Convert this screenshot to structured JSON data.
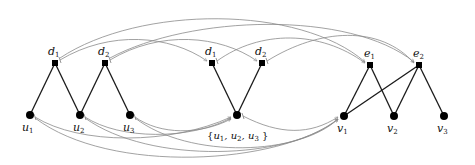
{
  "diagram": {
    "title": "",
    "colors": {
      "edge": "#1a1a1a",
      "arc": "#8a8a8a",
      "node": "#000000",
      "background": "#ffffff"
    },
    "groups": [
      {
        "name": "left-graph",
        "nodes": [
          {
            "id": "L_d1",
            "label": "d",
            "sub": "1",
            "shape": "square",
            "x": 55,
            "y": 63
          },
          {
            "id": "L_d2",
            "label": "d",
            "sub": "2",
            "shape": "square",
            "x": 105,
            "y": 63
          },
          {
            "id": "L_u1",
            "label": "u",
            "sub": "1",
            "shape": "circle",
            "x": 30,
            "y": 115
          },
          {
            "id": "L_u2",
            "label": "u",
            "sub": "2",
            "shape": "circle",
            "x": 80,
            "y": 115
          },
          {
            "id": "L_u3",
            "label": "u",
            "sub": "3",
            "shape": "circle",
            "x": 130,
            "y": 115
          }
        ],
        "edges": [
          [
            "L_d1",
            "L_u1"
          ],
          [
            "L_d1",
            "L_u2"
          ],
          [
            "L_d2",
            "L_u2"
          ],
          [
            "L_d2",
            "L_u3"
          ]
        ]
      },
      {
        "name": "middle-graph",
        "nodes": [
          {
            "id": "M_d1",
            "label": "d",
            "sub": "1",
            "shape": "square",
            "x": 212,
            "y": 63
          },
          {
            "id": "M_d2",
            "label": "d",
            "sub": "2",
            "shape": "square",
            "x": 262,
            "y": 63
          },
          {
            "id": "M_u",
            "label": "{u1, u2, u3}",
            "shape": "circle",
            "x": 237,
            "y": 115
          }
        ],
        "edges": [
          [
            "M_d1",
            "M_u"
          ],
          [
            "M_d2",
            "M_u"
          ]
        ]
      },
      {
        "name": "right-graph",
        "nodes": [
          {
            "id": "R_e1",
            "label": "e",
            "sub": "1",
            "shape": "square",
            "x": 370,
            "y": 65
          },
          {
            "id": "R_e2",
            "label": "e",
            "sub": "2",
            "shape": "square",
            "x": 419,
            "y": 65
          },
          {
            "id": "R_v1",
            "label": "v",
            "sub": "1",
            "shape": "circle",
            "x": 344,
            "y": 116
          },
          {
            "id": "R_v2",
            "label": "v",
            "sub": "2",
            "shape": "circle",
            "x": 394,
            "y": 116
          },
          {
            "id": "R_v3",
            "label": "v",
            "sub": "3",
            "shape": "circle",
            "x": 444,
            "y": 116
          }
        ],
        "edges": [
          [
            "R_e1",
            "R_v1"
          ],
          [
            "R_e1",
            "R_v2"
          ],
          [
            "R_e2",
            "R_v1"
          ],
          [
            "R_e2",
            "R_v2"
          ],
          [
            "R_e2",
            "R_v3"
          ]
        ]
      }
    ],
    "mappings": [
      {
        "from": "L_d1",
        "to": "M_d1"
      },
      {
        "from": "L_d2",
        "to": "M_d2"
      },
      {
        "from": "L_d1",
        "to": "R_e1"
      },
      {
        "from": "L_d2",
        "to": "R_e2"
      },
      {
        "from": "M_d1",
        "to": "R_e1"
      },
      {
        "from": "M_d2",
        "to": "R_e2"
      },
      {
        "from": "L_u1",
        "to": "M_u"
      },
      {
        "from": "L_u2",
        "to": "M_u"
      },
      {
        "from": "L_u3",
        "to": "M_u"
      },
      {
        "from": "L_u1",
        "to": "R_v1"
      },
      {
        "from": "L_u2",
        "to": "R_v1"
      },
      {
        "from": "L_u3",
        "to": "R_v1"
      },
      {
        "from": "M_u",
        "to": "R_v1"
      }
    ],
    "labels": {
      "L_d1": "d",
      "L_d1_sub": "1",
      "L_d2": "d",
      "L_d2_sub": "2",
      "L_u1": "u",
      "L_u1_sub": "1",
      "L_u2": "u",
      "L_u2_sub": "2",
      "L_u3": "u",
      "L_u3_sub": "3",
      "M_d1": "d",
      "M_d1_sub": "1",
      "M_d2": "d",
      "M_d2_sub": "2",
      "M_set_open": "{",
      "M_set_u": "u",
      "M_set_1": "1",
      "M_set_c1": ", u",
      "M_set_2": "2",
      "M_set_c2": ", u",
      "M_set_3": "3",
      "M_set_close": " }",
      "R_e1": "e",
      "R_e1_sub": "1",
      "R_e2": "e",
      "R_e2_sub": "2",
      "R_v1": "v",
      "R_v1_sub": "1",
      "R_v2": "v",
      "R_v2_sub": "2",
      "R_v3": "v",
      "R_v3_sub": "3"
    }
  }
}
